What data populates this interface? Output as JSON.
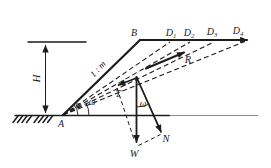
{
  "diagram": {
    "name": "slope-planar-slip-surface-force-diagram",
    "colors": {
      "ink": "#1c1c1c",
      "background": "#ffffff",
      "ground_line_far": "#8a8a8a"
    },
    "labels": [
      {
        "id": "height-H",
        "text": "H",
        "x": 40,
        "y": 78.5,
        "rotate": -90,
        "size": 11
      },
      {
        "id": "point-A",
        "text": "A",
        "x": 61,
        "y": 127,
        "size": 10
      },
      {
        "id": "point-B",
        "text": "B",
        "x": 134,
        "y": 36,
        "size": 10
      },
      {
        "id": "point-D1",
        "text": "D",
        "sub": "1",
        "x": 171,
        "y": 36,
        "size": 10
      },
      {
        "id": "point-D2",
        "text": "D",
        "sub": "2",
        "x": 189,
        "y": 36,
        "size": 10
      },
      {
        "id": "point-D3",
        "text": "D",
        "sub": "3",
        "x": 212,
        "y": 35,
        "size": 10
      },
      {
        "id": "point-D4",
        "text": "D",
        "sub": "4",
        "x": 238,
        "y": 34,
        "size": 10
      },
      {
        "id": "slope-ratio",
        "text": "1 : m",
        "x": 100,
        "y": 71,
        "rotate": -47,
        "size": 9
      },
      {
        "id": "angle-alpha",
        "text": "α",
        "x": 78,
        "y": 108,
        "size": 9.5
      },
      {
        "id": "angle-omega-toe",
        "text": "ω",
        "x": 92,
        "y": 105,
        "size": 9.5
      },
      {
        "id": "force-R",
        "text": "R",
        "x": 188,
        "y": 63,
        "size": 10.5
      },
      {
        "id": "force-T",
        "text": "T",
        "x": 118,
        "y": 97,
        "size": 10
      },
      {
        "id": "angle-omega-force",
        "text": "ω",
        "x": 143,
        "y": 107,
        "size": 9.5
      },
      {
        "id": "force-W",
        "text": "W",
        "x": 134,
        "y": 157,
        "size": 10.5
      },
      {
        "id": "force-N",
        "text": "N",
        "x": 166,
        "y": 142,
        "size": 10.5
      }
    ]
  }
}
